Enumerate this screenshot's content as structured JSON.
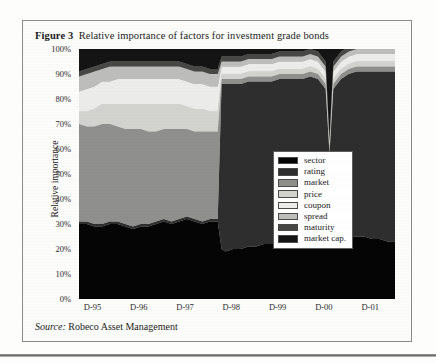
{
  "figure": {
    "label": "Figure 3",
    "title": "Relative importance of factors for investment grade bonds",
    "source_prefix": "Source:",
    "source_text": "Robeco Asset Management"
  },
  "legend": {
    "items": [
      {
        "label": "sector",
        "color": "#050505"
      },
      {
        "label": "rating",
        "color": "#2e2e2e"
      },
      {
        "label": "market",
        "color": "#8f8f8d"
      },
      {
        "label": "price",
        "color": "#d2d2cf"
      },
      {
        "label": "coupon",
        "color": "#ececea"
      },
      {
        "label": "spread",
        "color": "#bdbdbb"
      },
      {
        "label": "maturity",
        "color": "#474745"
      },
      {
        "label": "market cap.",
        "color": "#141414"
      }
    ]
  },
  "chart_data": {
    "type": "area",
    "stacked": true,
    "title": "Relative importance of factors for investment grade bonds",
    "xlabel": "",
    "ylabel": "Relative importance",
    "ylim": [
      0,
      100
    ],
    "yticks": [
      "0%",
      "10%",
      "20%",
      "30%",
      "40%",
      "50%",
      "60%",
      "70%",
      "80%",
      "90%",
      "100%"
    ],
    "xticks": [
      "D-95",
      "D-96",
      "D-97",
      "D-98",
      "D-99",
      "D-00",
      "D-01"
    ],
    "grid": false,
    "legend_position": "inside-right",
    "x": [
      0,
      2,
      4,
      6,
      8,
      10,
      12,
      14,
      16,
      18,
      20,
      22,
      24,
      26,
      28,
      30,
      32,
      34,
      36,
      37,
      38,
      40,
      42,
      44,
      46,
      48,
      50,
      52,
      54,
      56,
      58,
      60,
      62,
      64,
      65,
      66,
      68,
      70,
      72,
      74,
      76,
      78,
      80,
      82
    ],
    "series": [
      {
        "name": "sector",
        "color": "#050505",
        "values": [
          30,
          30,
          29,
          29,
          30,
          30,
          29,
          28,
          29,
          29,
          30,
          31,
          30,
          31,
          32,
          31,
          30,
          31,
          31,
          20,
          19,
          20,
          20,
          21,
          21,
          22,
          22,
          22,
          22,
          23,
          23,
          23,
          24,
          24,
          25,
          24,
          24,
          25,
          25,
          25,
          24,
          24,
          23,
          23
        ]
      },
      {
        "name": "rating",
        "color": "#2e2e2e",
        "values": [
          1,
          1,
          1,
          1,
          1,
          1,
          1,
          1,
          1,
          1,
          1,
          1,
          1,
          1,
          1,
          1,
          1,
          1,
          1,
          66,
          67,
          66,
          66,
          66,
          66,
          65,
          65,
          66,
          66,
          65,
          65,
          66,
          64,
          60,
          33,
          60,
          64,
          65,
          66,
          66,
          67,
          67,
          68,
          68
        ]
      },
      {
        "name": "market",
        "color": "#8f8f8d",
        "values": [
          39,
          38,
          39,
          40,
          39,
          38,
          38,
          39,
          38,
          37,
          36,
          36,
          37,
          36,
          35,
          35,
          36,
          35,
          35,
          2,
          2,
          2,
          2,
          2,
          2,
          2,
          2,
          2,
          2,
          2,
          2,
          2,
          2,
          2,
          2,
          2,
          2,
          2,
          2,
          2,
          2,
          2,
          2,
          2
        ]
      },
      {
        "name": "price",
        "color": "#d2d2cf",
        "values": [
          5,
          6,
          7,
          8,
          8,
          9,
          10,
          10,
          10,
          11,
          11,
          10,
          10,
          10,
          9,
          9,
          9,
          8,
          8,
          2,
          2,
          2,
          2,
          2,
          2,
          2,
          2,
          2,
          2,
          2,
          2,
          2,
          2,
          2,
          1,
          2,
          2,
          2,
          2,
          2,
          2,
          2,
          2,
          2
        ]
      },
      {
        "name": "coupon",
        "color": "#ececea",
        "values": [
          8,
          9,
          9,
          9,
          9,
          10,
          10,
          10,
          10,
          10,
          10,
          10,
          10,
          10,
          10,
          10,
          10,
          10,
          10,
          3,
          3,
          3,
          3,
          3,
          3,
          3,
          3,
          3,
          3,
          3,
          3,
          3,
          3,
          3,
          1,
          3,
          3,
          3,
          3,
          3,
          3,
          3,
          3,
          3
        ]
      },
      {
        "name": "spread",
        "color": "#bdbdbb",
        "values": [
          6,
          6,
          6,
          5,
          6,
          5,
          5,
          5,
          5,
          5,
          5,
          5,
          5,
          5,
          5,
          5,
          5,
          5,
          5,
          2,
          2,
          2,
          2,
          2,
          2,
          2,
          2,
          2,
          2,
          2,
          2,
          2,
          2,
          2,
          1,
          2,
          2,
          2,
          2,
          2,
          2,
          2,
          2,
          2
        ]
      },
      {
        "name": "maturity",
        "color": "#474745",
        "values": [
          2,
          2,
          2,
          2,
          2,
          2,
          2,
          2,
          2,
          2,
          2,
          2,
          2,
          2,
          2,
          2,
          2,
          2,
          2,
          2,
          2,
          2,
          2,
          2,
          2,
          2,
          2,
          2,
          2,
          2,
          2,
          2,
          2,
          2,
          1,
          2,
          2,
          2,
          2,
          2,
          2,
          2,
          2,
          2
        ]
      },
      {
        "name": "market cap.",
        "color": "#141414",
        "values": [
          9,
          8,
          7,
          6,
          5,
          5,
          5,
          5,
          5,
          5,
          5,
          5,
          5,
          5,
          6,
          7,
          7,
          8,
          8,
          3,
          3,
          3,
          3,
          2,
          2,
          2,
          2,
          1,
          1,
          1,
          1,
          0,
          1,
          5,
          36,
          5,
          1,
          1,
          0,
          0,
          0,
          0,
          0,
          0
        ]
      }
    ]
  }
}
